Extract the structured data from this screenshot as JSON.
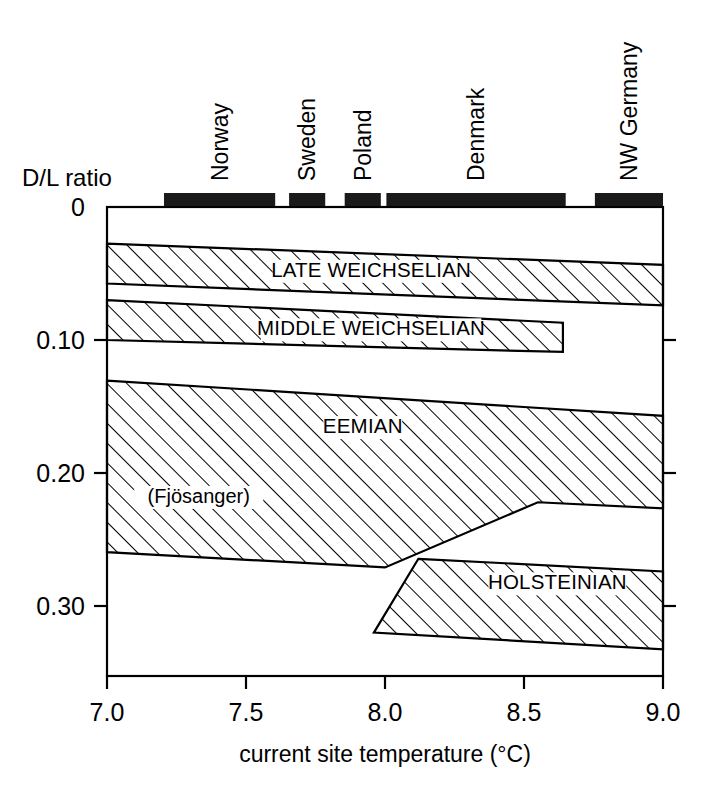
{
  "chart_data": {
    "type": "area",
    "title": "",
    "xlabel": "current site temperature (°C)",
    "ylabel": "D/L ratio",
    "xlim": [
      7.0,
      9.0
    ],
    "ylim": [
      0,
      0.33
    ],
    "y_axis_inverted": true,
    "grid": false,
    "legend": "none",
    "xticks": [
      {
        "value": 7.0,
        "label": "7.0"
      },
      {
        "value": 7.5,
        "label": "7.5"
      },
      {
        "value": 8.0,
        "label": "8.0"
      },
      {
        "value": 8.5,
        "label": "8.5"
      },
      {
        "value": 9.0,
        "label": "9.0"
      }
    ],
    "yticks": [
      {
        "value": 0.0,
        "label": "0"
      },
      {
        "value": 0.1,
        "label": "0.10"
      },
      {
        "value": 0.2,
        "label": "0.20"
      },
      {
        "value": 0.3,
        "label": "0.30"
      }
    ],
    "bands": [
      {
        "name": "late-weichselian",
        "label": "LATE WEICHSELIAN",
        "label_x": 7.95,
        "label_y": 0.0525,
        "hatch": "forward-slash",
        "upper_boundary": [
          {
            "x": 7.0,
            "y": 0.0275
          },
          {
            "x": 9.0,
            "y": 0.0435
          }
        ],
        "lower_boundary": [
          {
            "x": 7.0,
            "y": 0.0575
          },
          {
            "x": 9.0,
            "y": 0.074
          }
        ]
      },
      {
        "name": "middle-weichselian",
        "label": "MIDDLE WEICHSELIAN",
        "label_x": 7.95,
        "label_y": 0.0965,
        "hatch": "forward-slash",
        "upper_boundary": [
          {
            "x": 7.0,
            "y": 0.07
          },
          {
            "x": 8.64,
            "y": 0.087
          }
        ],
        "lower_boundary": [
          {
            "x": 7.0,
            "y": 0.1
          },
          {
            "x": 8.64,
            "y": 0.109
          }
        ]
      },
      {
        "name": "eemian",
        "label": "EEMIAN",
        "label_x": 7.92,
        "label_y": 0.17,
        "hatch": "forward-slash",
        "sub_label": "(Fjösanger)",
        "sub_label_x": 7.33,
        "sub_label_y": 0.2225,
        "upper_boundary": [
          {
            "x": 7.0,
            "y": 0.1305
          },
          {
            "x": 9.0,
            "y": 0.157
          }
        ],
        "lower_boundary": [
          {
            "x": 7.0,
            "y": 0.2595
          },
          {
            "x": 8.0,
            "y": 0.271
          },
          {
            "x": 8.55,
            "y": 0.222
          },
          {
            "x": 9.0,
            "y": 0.2265
          }
        ]
      },
      {
        "name": "holsteinian",
        "label": "HOLSTEINIAN",
        "label_x": 8.62,
        "label_y": 0.2875,
        "hatch": "forward-slash",
        "polygon": [
          {
            "x": 8.12,
            "y": 0.2645
          },
          {
            "x": 9.0,
            "y": 0.274
          },
          {
            "x": 9.0,
            "y": 0.3325
          },
          {
            "x": 7.96,
            "y": 0.32
          }
        ]
      }
    ],
    "coverage_bars": [
      {
        "label": "Norway",
        "x_start": 7.205,
        "x_end": 7.605
      },
      {
        "label": "Sweden",
        "x_start": 7.655,
        "x_end": 7.785
      },
      {
        "label": "Poland",
        "x_start": 7.855,
        "x_end": 7.985
      },
      {
        "label": "Denmark",
        "x_start": 8.005,
        "x_end": 8.65
      },
      {
        "label": "NW Germany",
        "x_start": 8.755,
        "x_end": 9.0
      }
    ]
  }
}
